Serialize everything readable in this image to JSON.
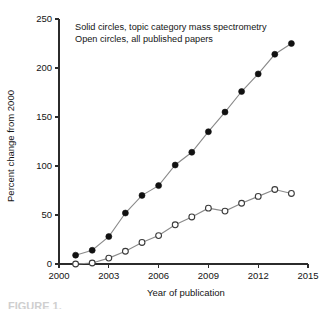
{
  "figure": {
    "caption_fragment": "FIGURE 1."
  },
  "chart_data": {
    "type": "line",
    "title": "",
    "xlabel": "Year of publication",
    "ylabel": "Percent change from 2000",
    "xlim": [
      2000,
      2015
    ],
    "ylim": [
      0,
      250
    ],
    "xticks": [
      2000,
      2003,
      2006,
      2009,
      2012,
      2015
    ],
    "yticks": [
      0,
      50,
      100,
      150,
      200,
      250
    ],
    "xtick_labels": [
      "2000",
      "2003",
      "2006",
      "2009",
      "2012",
      "2015"
    ],
    "ytick_labels": [
      "0",
      "50",
      "100",
      "150",
      "200",
      "250"
    ],
    "grid": false,
    "legend_position": "top-left-inside",
    "x": [
      2001,
      2002,
      2003,
      2004,
      2005,
      2006,
      2007,
      2008,
      2009,
      2010,
      2011,
      2012,
      2013,
      2014
    ],
    "series": [
      {
        "name": "Solid circles, topic category mass spectrometry",
        "marker": "solid-circle",
        "values": [
          9,
          14,
          28,
          52,
          70,
          80,
          101,
          114,
          135,
          155,
          176,
          194,
          214,
          225
        ]
      },
      {
        "name": "Open circles, all published papers",
        "marker": "open-circle",
        "values": [
          0,
          1,
          6,
          13,
          22,
          29,
          40,
          48,
          57,
          54,
          62,
          69,
          76,
          72
        ]
      }
    ],
    "annotations": [
      "Solid circles, topic category mass spectrometry",
      "Open circles, all published papers"
    ],
    "colors": {
      "solid_marker": "#111111",
      "open_marker_stroke": "#3a3a3a",
      "open_marker_fill": "#ffffff",
      "line": "#8a8a8a",
      "axis": "#2b2b2b",
      "background": "#ffffff"
    }
  }
}
